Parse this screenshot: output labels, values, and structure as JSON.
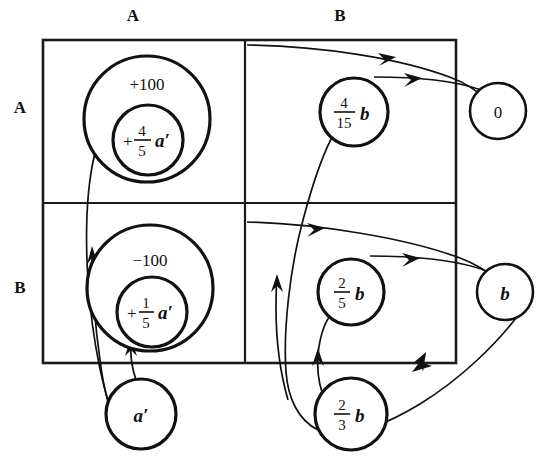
{
  "figure": {
    "type": "state-transition-diagram",
    "background_color": "#ffffff",
    "ink_color": "#111111",
    "column_header_label": "columns",
    "row_header_label": "rows"
  },
  "columns": [
    {
      "id": "col-A",
      "label": "A"
    },
    {
      "id": "col-B",
      "label": "B"
    }
  ],
  "rows": [
    {
      "id": "row-A",
      "label": "A"
    },
    {
      "id": "row-B",
      "label": "B"
    }
  ],
  "cells": [
    {
      "id": "cell-AA",
      "row": "A",
      "col": "A"
    },
    {
      "id": "cell-AB",
      "row": "A",
      "col": "B"
    },
    {
      "id": "cell-BA",
      "row": "B",
      "col": "A"
    },
    {
      "id": "cell-BB",
      "row": "B",
      "col": "B"
    }
  ],
  "nodes": [
    {
      "id": "node-plus-100",
      "name": "outer-circle-plus-100",
      "cell": "cell-AA",
      "kind": "outer",
      "text": "+100",
      "cx": 147,
      "cy": 119,
      "r": 63
    },
    {
      "id": "node-plus-4-5-a",
      "name": "inner-circle-plus-four-fifths-a-prime",
      "cell": "cell-AA",
      "kind": "inner",
      "sign": "+",
      "numerator": "4",
      "denominator": "5",
      "variable": "a′",
      "text": "+4/5 a′",
      "cx": 148,
      "cy": 140,
      "r": 35
    },
    {
      "id": "node-minus-100",
      "name": "outer-circle-minus-100",
      "cell": "cell-BA",
      "kind": "outer",
      "text": "−100",
      "cx": 150,
      "cy": 288,
      "r": 63
    },
    {
      "id": "node-plus-1-5-a",
      "name": "inner-circle-plus-one-fifth-a-prime",
      "cell": "cell-BA",
      "kind": "inner",
      "sign": "+",
      "numerator": "1",
      "denominator": "5",
      "variable": "a′",
      "text": "+1/5 a′",
      "cx": 152,
      "cy": 312,
      "r": 35
    },
    {
      "id": "node-4-15-b",
      "name": "circle-four-fifteenths-b",
      "cell": "cell-AB",
      "kind": "plain",
      "numerator": "4",
      "denominator": "15",
      "variable": "b",
      "text": "4/15 b",
      "cx": 354,
      "cy": 112,
      "r": 34
    },
    {
      "id": "node-2-5-b",
      "name": "circle-two-fifths-b",
      "cell": "cell-BB",
      "kind": "plain",
      "numerator": "2",
      "denominator": "5",
      "variable": "b",
      "text": "2/5 b",
      "cx": 351,
      "cy": 292,
      "r": 33
    },
    {
      "id": "node-2-3-b",
      "name": "circle-two-thirds-b",
      "cell": "outside-bottom",
      "kind": "plain",
      "numerator": "2",
      "denominator": "3",
      "variable": "b",
      "text": "2/3 b",
      "cx": 351,
      "cy": 414,
      "r": 36
    },
    {
      "id": "node-0",
      "name": "circle-zero",
      "cell": "outside-right-top",
      "kind": "plain",
      "text": "0",
      "cx": 498,
      "cy": 111,
      "r": 28
    },
    {
      "id": "node-b",
      "name": "circle-b",
      "cell": "outside-right-bottom",
      "kind": "plain",
      "variable": "b",
      "text": "b",
      "cx": 505,
      "cy": 292,
      "r": 28
    },
    {
      "id": "node-a-prime",
      "name": "circle-a-prime",
      "cell": "outside-bottom-left",
      "kind": "plain",
      "variable": "a′",
      "text": "a′",
      "cx": 141,
      "cy": 414,
      "r": 35
    }
  ],
  "arrows": [
    {
      "id": "arrow-1",
      "name": "arrow-a-prime-to-plus-100",
      "from": "node-a-prime",
      "to": "node-plus-100"
    },
    {
      "id": "arrow-2",
      "name": "arrow-a-prime-to-minus-100",
      "from": "node-a-prime",
      "to": "node-minus-100"
    },
    {
      "id": "arrow-3",
      "name": "arrow-2-3-b-to-4-15-b",
      "from": "node-2-3-b",
      "to": "node-4-15-b"
    },
    {
      "id": "arrow-4",
      "name": "arrow-2-3-b-to-2-5-b",
      "from": "node-2-3-b",
      "to": "node-2-5-b"
    },
    {
      "id": "arrow-5",
      "name": "arrow-4-15-b-to-zero",
      "from": "node-4-15-b",
      "to": "node-0"
    },
    {
      "id": "arrow-6",
      "name": "arrow-2-5-b-to-b",
      "from": "node-2-5-b",
      "to": "node-b"
    },
    {
      "id": "arrow-7",
      "name": "arrow-row-A-top-to-zero",
      "from": "cell-AB",
      "to": "node-0"
    },
    {
      "id": "arrow-8",
      "name": "arrow-row-B-top-to-b",
      "from": "cell-BB",
      "to": "node-b"
    },
    {
      "id": "arrow-9",
      "name": "arrow-b-to-2-3-b",
      "from": "node-b",
      "to": "node-2-3-b"
    }
  ],
  "grid": {
    "left": 43,
    "top": 40,
    "right": 456,
    "bottom": 363,
    "mid_x": 245,
    "mid_y": 203
  }
}
